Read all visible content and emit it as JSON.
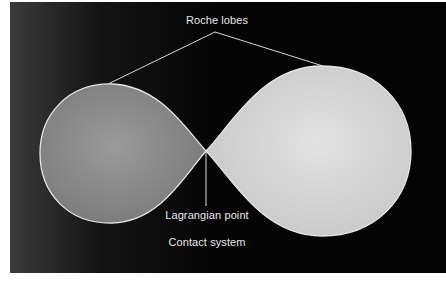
{
  "diagram": {
    "labels": {
      "top": "Roche lobes",
      "point": "Lagrangian point",
      "caption": "Contact system"
    },
    "colors": {
      "background": "#050505",
      "left_lobe": "#8e8e8e",
      "right_lobe": "#d8d8d8",
      "outline": "#e6e6e6",
      "text": "#e8e8e8"
    },
    "elements": [
      {
        "name": "left-roche-lobe",
        "shape": "teardrop",
        "relative_size": "smaller",
        "shade": "medium gray"
      },
      {
        "name": "right-roche-lobe",
        "shape": "teardrop",
        "relative_size": "larger",
        "shade": "light gray"
      },
      {
        "name": "lagrangian-point",
        "description": "contact point where lobes meet"
      }
    ]
  }
}
